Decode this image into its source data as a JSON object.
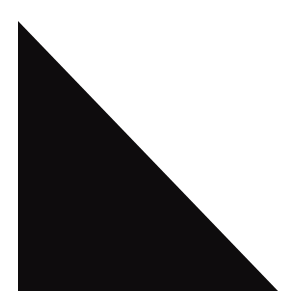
{
  "shape": {
    "type": "right-triangle",
    "fill": "#0e0c0d",
    "background": "#ffffff",
    "points": [
      [
        18,
        21
      ],
      [
        18,
        291
      ],
      [
        278,
        291
      ]
    ]
  }
}
